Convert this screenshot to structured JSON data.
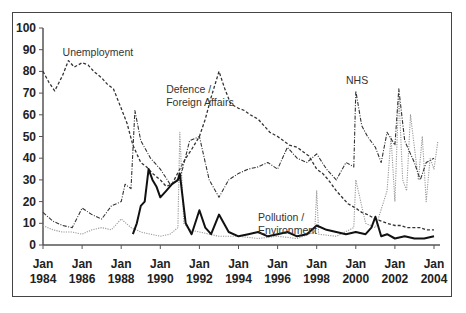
{
  "chart_data": {
    "type": "line",
    "title": "",
    "xlabel": "",
    "ylabel": "",
    "ylim": [
      0,
      100
    ],
    "yticks": [
      0,
      10,
      20,
      30,
      40,
      50,
      60,
      70,
      80,
      90,
      100
    ],
    "xticks": [
      "Jan 1984",
      "Jan 1986",
      "Jan 1988",
      "Jan 1990",
      "Jan 1992",
      "Jan 1994",
      "Jan 1996",
      "Jan 1998",
      "Jan 2000",
      "Jan 2002",
      "Jan 2004"
    ],
    "xrange": [
      1984.0,
      2004.3
    ],
    "grid": false,
    "legend": "none (series labelled by in-plot annotations)",
    "annotations": [
      {
        "text": "Unemployment",
        "x": 1985.0,
        "y": 87
      },
      {
        "text": "Defence /\nForeign Affairs",
        "x": 1990.3,
        "y": 70
      },
      {
        "text": "NHS",
        "x": 1999.5,
        "y": 74
      },
      {
        "text": "Pollution /\nEnvironment",
        "x": 1995.0,
        "y": 11
      }
    ],
    "series": [
      {
        "name": "Unemployment",
        "style": "dashed",
        "x": [
          1984.0,
          1984.3,
          1984.6,
          1985.0,
          1985.3,
          1985.6,
          1986.0,
          1986.3,
          1986.6,
          1987.0,
          1987.3,
          1987.6,
          1988.0,
          1988.3,
          1988.6,
          1989.0,
          1989.3,
          1989.6,
          1990.0,
          1990.3,
          1990.6,
          1991.0,
          1991.3,
          1991.6,
          1992.0,
          1992.3,
          1992.6,
          1993.0,
          1993.3,
          1993.6,
          1994.0,
          1994.3,
          1994.6,
          1995.0,
          1995.3,
          1995.6,
          1996.0,
          1996.3,
          1996.6,
          1997.0,
          1997.3,
          1997.6,
          1998.0,
          1998.3,
          1998.6,
          1999.0,
          1999.3,
          1999.6,
          2000.0,
          2000.3,
          2000.6,
          2001.0,
          2001.3,
          2001.6,
          2002.0,
          2002.3,
          2002.6,
          2003.0,
          2003.3,
          2003.6,
          2004.0
        ],
        "values": [
          80,
          75,
          71,
          78,
          85,
          82,
          84,
          83,
          80,
          77,
          74,
          72,
          63,
          56,
          46,
          38,
          36,
          33,
          30,
          27,
          28,
          35,
          40,
          44,
          50,
          58,
          68,
          80,
          72,
          65,
          63,
          62,
          60,
          58,
          55,
          52,
          50,
          48,
          46,
          45,
          43,
          41,
          35,
          33,
          30,
          25,
          22,
          19,
          17,
          15,
          14,
          12,
          11,
          10,
          9,
          9,
          8,
          8,
          8,
          7,
          7
        ]
      },
      {
        "name": "Defence / Foreign Affairs",
        "style": "dotted",
        "x": [
          1984.0,
          1984.5,
          1985.0,
          1985.5,
          1986.0,
          1986.5,
          1987.0,
          1987.5,
          1988.0,
          1988.5,
          1989.0,
          1989.5,
          1990.0,
          1990.5,
          1990.9,
          1991.0,
          1991.2,
          1991.5,
          1992.0,
          1992.5,
          1993.0,
          1994.0,
          1995.0,
          1996.0,
          1997.0,
          1997.9,
          1998.0,
          1998.1,
          1999.0,
          1999.9,
          2000.0,
          2000.5,
          2001.0,
          2001.6,
          2001.8,
          2002.0,
          2002.2,
          2002.4,
          2002.6,
          2002.8,
          2003.0,
          2003.2,
          2003.4,
          2003.6,
          2003.8,
          2004.0,
          2004.2
        ],
        "values": [
          9,
          7,
          6,
          6,
          5,
          7,
          8,
          7,
          12,
          8,
          6,
          5,
          4,
          5,
          8,
          52,
          10,
          7,
          6,
          5,
          4,
          4,
          3,
          4,
          3,
          6,
          25,
          5,
          4,
          8,
          30,
          10,
          8,
          25,
          50,
          20,
          70,
          30,
          25,
          60,
          45,
          30,
          50,
          20,
          40,
          35,
          48
        ]
      },
      {
        "name": "NHS",
        "style": "dash-dot",
        "x": [
          1984.0,
          1984.5,
          1985.0,
          1985.5,
          1986.0,
          1986.5,
          1987.0,
          1987.5,
          1988.0,
          1988.2,
          1988.5,
          1988.7,
          1989.0,
          1989.5,
          1990.0,
          1990.5,
          1991.0,
          1991.5,
          1992.0,
          1992.5,
          1993.0,
          1993.5,
          1994.0,
          1994.5,
          1995.0,
          1995.5,
          1996.0,
          1996.5,
          1997.0,
          1997.5,
          1998.0,
          1998.5,
          1999.0,
          1999.5,
          1999.9,
          2000.0,
          2000.3,
          2000.6,
          2001.0,
          2001.3,
          2001.6,
          2002.0,
          2002.2,
          2002.5,
          2002.8,
          2003.0,
          2003.3,
          2003.6,
          2004.0
        ],
        "values": [
          15,
          11,
          9,
          8,
          17,
          14,
          12,
          18,
          20,
          28,
          26,
          62,
          48,
          40,
          35,
          28,
          30,
          48,
          50,
          30,
          22,
          30,
          33,
          35,
          36,
          38,
          35,
          45,
          40,
          38,
          42,
          35,
          30,
          38,
          36,
          71,
          55,
          50,
          45,
          38,
          52,
          46,
          72,
          48,
          42,
          38,
          30,
          38,
          40
        ]
      },
      {
        "name": "Pollution / Environment",
        "style": "solid-bold",
        "x": [
          1988.6,
          1988.8,
          1989.0,
          1989.2,
          1989.4,
          1989.6,
          1989.8,
          1990.0,
          1990.3,
          1990.6,
          1990.9,
          1991.0,
          1991.3,
          1991.6,
          1992.0,
          1992.3,
          1992.6,
          1993.0,
          1993.5,
          1994.0,
          1994.5,
          1995.0,
          1995.5,
          1996.0,
          1996.5,
          1997.0,
          1997.5,
          1998.0,
          1998.5,
          1999.0,
          1999.5,
          2000.0,
          2000.5,
          2000.8,
          2001.0,
          2001.3,
          2001.6,
          2002.0,
          2002.5,
          2003.0,
          2003.5,
          2004.0
        ],
        "values": [
          5,
          10,
          18,
          20,
          35,
          30,
          27,
          22,
          25,
          28,
          30,
          33,
          10,
          5,
          16,
          8,
          5,
          14,
          6,
          4,
          5,
          6,
          4,
          5,
          6,
          4,
          5,
          9,
          7,
          6,
          5,
          6,
          5,
          8,
          13,
          4,
          5,
          3,
          4,
          3,
          3,
          4
        ]
      }
    ]
  }
}
